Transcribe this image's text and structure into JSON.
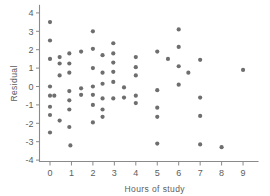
{
  "chart_data": {
    "type": "scatter",
    "title": "",
    "xlabel": "Hours of study",
    "ylabel": "Residual",
    "xlim": [
      -0.45,
      9.6
    ],
    "ylim": [
      -4.4,
      4.3
    ],
    "grid": false,
    "legend": null,
    "xticks": [
      0,
      1,
      2,
      3,
      4,
      5,
      6,
      7,
      8,
      9
    ],
    "xtick_labels": [
      "0",
      "1",
      "2",
      "3",
      "4",
      "5",
      "6",
      "7",
      "8",
      "9"
    ],
    "yticks": [
      -4,
      -3,
      -2,
      -1,
      0,
      1,
      2,
      3,
      4
    ],
    "ytick_labels": [
      "-4",
      "-3",
      "-2",
      "-1",
      "0",
      "1",
      "2",
      "3",
      "4"
    ],
    "marker": "circle",
    "marker_color": "#6e6e6e",
    "marker_size": 4.2,
    "axis_color": "#8a8a8a",
    "points": [
      [
        0.0,
        3.5
      ],
      [
        0.0,
        2.5
      ],
      [
        0.0,
        1.5
      ],
      [
        0.0,
        0.0
      ],
      [
        0.0,
        -0.5
      ],
      [
        0.0,
        -1.1
      ],
      [
        0.0,
        -1.55
      ],
      [
        0.0,
        -2.5
      ],
      [
        0.2,
        -0.5
      ],
      [
        0.45,
        1.6
      ],
      [
        0.45,
        1.25
      ],
      [
        0.45,
        0.6
      ],
      [
        0.45,
        -1.85
      ],
      [
        0.9,
        1.8
      ],
      [
        0.9,
        1.25
      ],
      [
        0.9,
        0.75
      ],
      [
        0.9,
        -0.25
      ],
      [
        0.9,
        -0.75
      ],
      [
        0.9,
        -1.25
      ],
      [
        0.9,
        -2.2
      ],
      [
        0.95,
        -3.2
      ],
      [
        1.45,
        1.9
      ],
      [
        1.45,
        -0.1
      ],
      [
        1.45,
        -0.45
      ],
      [
        2.0,
        3.0
      ],
      [
        2.0,
        2.05
      ],
      [
        2.0,
        1.0
      ],
      [
        2.0,
        0.0
      ],
      [
        2.0,
        -0.45
      ],
      [
        2.0,
        -1.0
      ],
      [
        2.0,
        -1.95
      ],
      [
        2.45,
        1.7
      ],
      [
        2.45,
        0.75
      ],
      [
        2.45,
        0.15
      ],
      [
        2.45,
        -0.65
      ],
      [
        2.45,
        -1.25
      ],
      [
        2.45,
        -1.65
      ],
      [
        2.95,
        2.35
      ],
      [
        2.95,
        1.8
      ],
      [
        2.95,
        1.3
      ],
      [
        2.95,
        0.8
      ],
      [
        2.95,
        0.25
      ],
      [
        2.95,
        -0.65
      ],
      [
        3.45,
        -0.05
      ],
      [
        3.45,
        -0.6
      ],
      [
        4.0,
        1.6
      ],
      [
        4.0,
        1.05
      ],
      [
        4.0,
        0.6
      ],
      [
        4.0,
        -0.5
      ],
      [
        4.0,
        -0.9
      ],
      [
        5.0,
        1.9
      ],
      [
        5.0,
        -0.2
      ],
      [
        5.0,
        -1.15
      ],
      [
        5.0,
        -1.65
      ],
      [
        5.0,
        -3.1
      ],
      [
        5.5,
        1.5
      ],
      [
        6.0,
        3.1
      ],
      [
        6.0,
        2.15
      ],
      [
        6.0,
        1.1
      ],
      [
        6.0,
        0.1
      ],
      [
        6.45,
        0.75
      ],
      [
        7.0,
        1.45
      ],
      [
        7.0,
        -0.6
      ],
      [
        7.0,
        -1.6
      ],
      [
        7.0,
        -3.15
      ],
      [
        8.0,
        -3.3
      ],
      [
        9.0,
        0.9
      ]
    ]
  }
}
